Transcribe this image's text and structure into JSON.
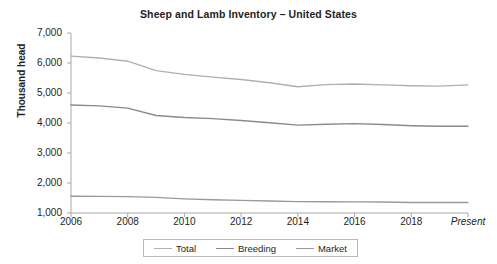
{
  "chart_data": {
    "type": "line",
    "title": "Sheep and Lamb Inventory – United States",
    "xlabel": "",
    "ylabel": "Thousand head",
    "ylim": [
      1000,
      7000
    ],
    "ytick_labels": [
      "7,000",
      "6,000",
      "5,000",
      "4,000",
      "3,000",
      "2,000",
      "1,000"
    ],
    "ytick_values": [
      7000,
      6000,
      5000,
      4000,
      3000,
      2000,
      1000
    ],
    "xtick_labels": [
      "2006",
      "2008",
      "2010",
      "2012",
      "2014",
      "2016",
      "2018",
      "Present"
    ],
    "xtick_values": [
      2006,
      2008,
      2010,
      2012,
      2014,
      2016,
      2018,
      2020
    ],
    "xlim": [
      2006,
      2020
    ],
    "grid": false,
    "legend_position": "bottom",
    "x": [
      2006,
      2007,
      2008,
      2009,
      2010,
      2011,
      2012,
      2013,
      2014,
      2015,
      2016,
      2017,
      2018,
      2019,
      2020
    ],
    "series": [
      {
        "name": "Total",
        "color": "#b0b0b0",
        "values": [
          6230,
          6165,
          6060,
          5747,
          5620,
          5530,
          5450,
          5340,
          5210,
          5280,
          5300,
          5270,
          5240,
          5230,
          5270
        ]
      },
      {
        "name": "Breeding",
        "color": "#8a8a8a",
        "values": [
          4600,
          4570,
          4495,
          4250,
          4185,
          4145,
          4085,
          4010,
          3930,
          3960,
          3980,
          3950,
          3910,
          3890,
          3890
        ]
      },
      {
        "name": "Market",
        "color": "#9a9a9a",
        "values": [
          1560,
          1555,
          1545,
          1520,
          1470,
          1440,
          1420,
          1400,
          1380,
          1375,
          1370,
          1365,
          1350,
          1350,
          1350
        ]
      }
    ]
  },
  "legend": {
    "items": [
      {
        "label": "Total"
      },
      {
        "label": "Breeding"
      },
      {
        "label": "Market"
      }
    ]
  },
  "axis": {
    "color": "#a8a8a8"
  }
}
